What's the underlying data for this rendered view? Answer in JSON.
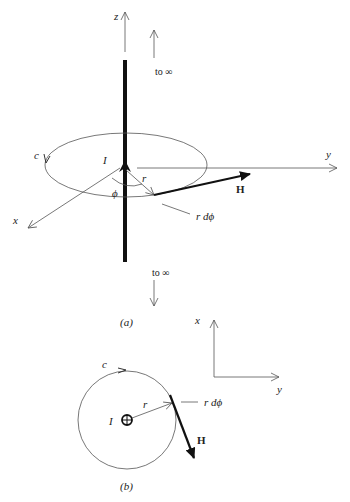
{
  "figure_a": {
    "caption": "(a)",
    "axes": {
      "z": "z",
      "y": "y",
      "x": "x"
    },
    "contour_label": "c",
    "current_label": "I",
    "angle_label": "ϕ",
    "radius_label": "r",
    "field_label": "H",
    "arc_element_label": "r dϕ",
    "to_infinity_top": "to ∞",
    "to_infinity_bottom": "to ∞"
  },
  "figure_b": {
    "caption": "(b)",
    "axes": {
      "x": "x",
      "y": "y"
    },
    "contour_label": "c",
    "current_label": "I",
    "radius_label": "r",
    "field_label": "H",
    "arc_element_label": "r dϕ",
    "current_symbol": "into-page (circle with cross)"
  },
  "colors": {
    "line": "#555555",
    "heavy": "#111111",
    "background": "#ffffff"
  }
}
